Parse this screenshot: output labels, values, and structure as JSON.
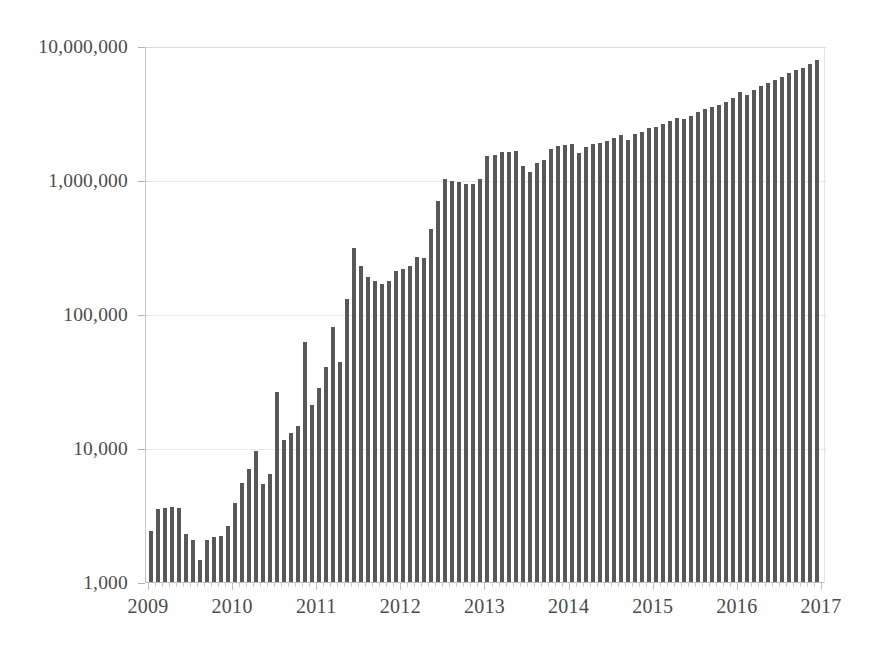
{
  "chart_data": {
    "type": "bar",
    "title": "",
    "subtitle": "",
    "xlabel": "",
    "ylabel": "",
    "yscale": "log",
    "ylim": [
      1000,
      10000000
    ],
    "xlim": [
      "2009",
      "2017"
    ],
    "grid": true,
    "legend": null,
    "legend_position": "none",
    "bar_color": "#585858",
    "gridline_color": "#d8d8d8",
    "axis_color": "#bdbdbd",
    "label_color": "#4b4b4b",
    "y_ticks": [
      {
        "value": 1000,
        "label": "1,000"
      },
      {
        "value": 10000,
        "label": "10,000"
      },
      {
        "value": 100000,
        "label": "100,000"
      },
      {
        "value": 1000000,
        "label": "1,000,000"
      },
      {
        "value": 10000000,
        "label": "10,000,000"
      }
    ],
    "x_ticks": [
      {
        "label": "2009",
        "index": 0
      },
      {
        "label": "2010",
        "index": 12
      },
      {
        "label": "2011",
        "index": 24
      },
      {
        "label": "2012",
        "index": 36
      },
      {
        "label": "2013",
        "index": 48
      },
      {
        "label": "2014",
        "index": 60
      },
      {
        "label": "2015",
        "index": 72
      },
      {
        "label": "2016",
        "index": 84
      },
      {
        "label": "2017",
        "index": 96
      }
    ],
    "categories": [
      "2009-01",
      "2009-02",
      "2009-03",
      "2009-04",
      "2009-05",
      "2009-06",
      "2009-07",
      "2009-08",
      "2009-09",
      "2009-10",
      "2009-11",
      "2009-12",
      "2010-01",
      "2010-02",
      "2010-03",
      "2010-04",
      "2010-05",
      "2010-06",
      "2010-07",
      "2010-08",
      "2010-09",
      "2010-10",
      "2010-11",
      "2010-12",
      "2011-01",
      "2011-02",
      "2011-03",
      "2011-04",
      "2011-05",
      "2011-06",
      "2011-07",
      "2011-08",
      "2011-09",
      "2011-10",
      "2011-11",
      "2011-12",
      "2012-01",
      "2012-02",
      "2012-03",
      "2012-04",
      "2012-05",
      "2012-06",
      "2012-07",
      "2012-08",
      "2012-09",
      "2012-10",
      "2012-11",
      "2012-12",
      "2013-01",
      "2013-02",
      "2013-03",
      "2013-04",
      "2013-05",
      "2013-06",
      "2013-07",
      "2013-08",
      "2013-09",
      "2013-10",
      "2013-11",
      "2013-12",
      "2014-01",
      "2014-02",
      "2014-03",
      "2014-04",
      "2014-05",
      "2014-06",
      "2014-07",
      "2014-08",
      "2014-09",
      "2014-10",
      "2014-11",
      "2014-12",
      "2015-01",
      "2015-02",
      "2015-03",
      "2015-04",
      "2015-05",
      "2015-06",
      "2015-07",
      "2015-08",
      "2015-09",
      "2015-10",
      "2015-11",
      "2015-12",
      "2016-01",
      "2016-02",
      "2016-03",
      "2016-04",
      "2016-05",
      "2016-06",
      "2016-07",
      "2016-08",
      "2016-09",
      "2016-10",
      "2016-11",
      "2016-12"
    ],
    "values": [
      2400,
      3500,
      3550,
      3600,
      3550,
      2300,
      2050,
      1450,
      2050,
      2150,
      2200,
      2600,
      3900,
      5500,
      7000,
      9500,
      5400,
      6400,
      26000,
      11500,
      13000,
      14500,
      62000,
      21000,
      28000,
      40000,
      80000,
      44000,
      130000,
      310000,
      230000,
      190000,
      175000,
      168000,
      175000,
      210000,
      215000,
      230000,
      265000,
      260000,
      430000,
      700000,
      1020000,
      980000,
      960000,
      940000,
      930000,
      1010000,
      1500000,
      1550000,
      1620000,
      1620000,
      1650000,
      1280000,
      1150000,
      1350000,
      1420000,
      1700000,
      1800000,
      1820000,
      1850000,
      1600000,
      1750000,
      1850000,
      1900000,
      1950000,
      2050000,
      2150000,
      2000000,
      2200000,
      2300000,
      2450000,
      2500000,
      2600000,
      2750000,
      2900000,
      2850000,
      3000000,
      3200000,
      3400000,
      3500000,
      3600000,
      3800000,
      4100000,
      4550000,
      4300000,
      4700000,
      5000000,
      5300000,
      5600000,
      5900000,
      6300000,
      6600000,
      6900000,
      7300000,
      7900000
    ]
  },
  "figure": {
    "background": "#ffffff",
    "plot_background": "#ffffff"
  }
}
